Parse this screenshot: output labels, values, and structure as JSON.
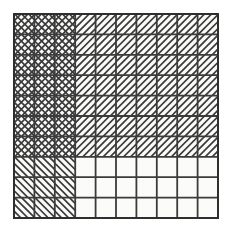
{
  "figure": {
    "caption": "Ten by ten square grid with three hatch-fill regions and one empty region",
    "width": 232,
    "height": 232,
    "background_color": "#ffffff"
  },
  "grid": {
    "columns": 10,
    "rows": 10,
    "origin_x": 14,
    "origin_y": 14,
    "cell_width": 20.4,
    "cell_height": 20.4,
    "line_color": "#3b3b3b",
    "outer_border_color": "#2e2e2e",
    "outer_border_width": 2.0,
    "inner_line_width": 1.8,
    "cell_fill_color": "#fbfbfa"
  },
  "hatching": {
    "color": "#3a3a3a",
    "line_width": 1.7,
    "spacing": 7.0,
    "directions": {
      "forward": "/",
      "backward": "\\",
      "cross": "X"
    }
  },
  "regions": [
    {
      "name": "top-left-crosshatch",
      "label": "Cross-hatched region",
      "col_start": 0,
      "col_end": 3,
      "row_start": 0,
      "row_end": 7,
      "fill": "cross",
      "hatch_color": "#3a3a3a"
    },
    {
      "name": "top-right-forward-hatch",
      "label": "Forward diagonal region",
      "col_start": 3,
      "col_end": 10,
      "row_start": 0,
      "row_end": 7,
      "fill": "forward",
      "hatch_color": "#3a3a3a"
    },
    {
      "name": "bottom-left-backward-hatch",
      "label": "Backward diagonal region",
      "col_start": 0,
      "col_end": 3,
      "row_start": 7,
      "row_end": 10,
      "fill": "backward",
      "hatch_color": "#3a3a3a"
    },
    {
      "name": "bottom-right-empty",
      "label": "Empty region",
      "col_start": 3,
      "col_end": 10,
      "row_start": 7,
      "row_end": 10,
      "fill": "none",
      "hatch_color": null
    }
  ],
  "chart_data": {
    "type": "heatmap",
    "xlabel": "",
    "ylabel": "",
    "columns": 10,
    "rows": 10,
    "legend": [
      {
        "key": "cross",
        "label": "Cross-hatched",
        "glyph": "X"
      },
      {
        "key": "forward",
        "label": "Forward diagonal",
        "glyph": "/"
      },
      {
        "key": "backward",
        "label": "Backward diagonal",
        "glyph": "\\"
      },
      {
        "key": "none",
        "label": "Empty",
        "glyph": " "
      }
    ],
    "grid": true,
    "legend_position": "none",
    "matrix": [
      [
        "cross",
        "cross",
        "cross",
        "forward",
        "forward",
        "forward",
        "forward",
        "forward",
        "forward",
        "forward"
      ],
      [
        "cross",
        "cross",
        "cross",
        "forward",
        "forward",
        "forward",
        "forward",
        "forward",
        "forward",
        "forward"
      ],
      [
        "cross",
        "cross",
        "cross",
        "forward",
        "forward",
        "forward",
        "forward",
        "forward",
        "forward",
        "forward"
      ],
      [
        "cross",
        "cross",
        "cross",
        "forward",
        "forward",
        "forward",
        "forward",
        "forward",
        "forward",
        "forward"
      ],
      [
        "cross",
        "cross",
        "cross",
        "forward",
        "forward",
        "forward",
        "forward",
        "forward",
        "forward",
        "forward"
      ],
      [
        "cross",
        "cross",
        "cross",
        "forward",
        "forward",
        "forward",
        "forward",
        "forward",
        "forward",
        "forward"
      ],
      [
        "cross",
        "cross",
        "cross",
        "forward",
        "forward",
        "forward",
        "forward",
        "forward",
        "forward",
        "forward"
      ],
      [
        "backward",
        "backward",
        "backward",
        "none",
        "none",
        "none",
        "none",
        "none",
        "none",
        "none"
      ],
      [
        "backward",
        "backward",
        "backward",
        "none",
        "none",
        "none",
        "none",
        "none",
        "none",
        "none"
      ],
      [
        "backward",
        "backward",
        "backward",
        "none",
        "none",
        "none",
        "none",
        "none",
        "none",
        "none"
      ]
    ],
    "counts": {
      "cross": 21,
      "forward": 49,
      "backward": 9,
      "none": 21
    }
  }
}
